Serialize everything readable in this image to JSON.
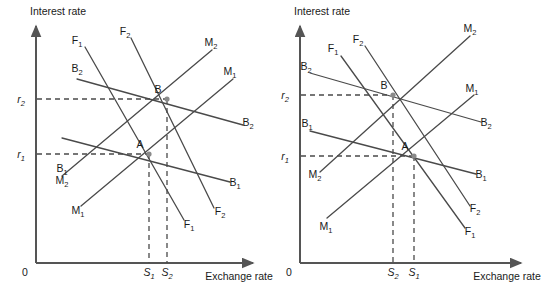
{
  "figure": {
    "title": "",
    "panels": [
      {
        "id": "left-panel",
        "name": "left-diagram",
        "origin_label": "0",
        "y_axis_label": "Interest rate",
        "x_axis_label": "Exchange rate",
        "axis": {
          "x0": 36,
          "y0": 263,
          "x_end": 253,
          "y_top": 26
        },
        "y_ticks": [
          {
            "label": "r",
            "sub": "2",
            "y": 99,
            "x": 21
          },
          {
            "label": "r",
            "sub": "1",
            "y": 154,
            "x": 21
          }
        ],
        "x_ticks": [
          {
            "label": "S",
            "sub": "1",
            "x": 149,
            "y": 276
          },
          {
            "label": "S",
            "sub": "2",
            "x": 167,
            "y": 276
          }
        ],
        "points": [
          {
            "label": "A",
            "x": 149,
            "y": 154,
            "lx": 140,
            "ly": 148
          },
          {
            "label": "B",
            "x": 167,
            "y": 99,
            "lx": 158,
            "ly": 93
          }
        ],
        "guides": [
          {
            "name": "guide-r2",
            "x1": 37,
            "y1": 99,
            "x2": 167,
            "y2": 99
          },
          {
            "name": "guide-r1",
            "x1": 37,
            "y1": 154,
            "x2": 149,
            "y2": 154
          },
          {
            "name": "guide-s1",
            "x1": 149,
            "y1": 154,
            "x2": 149,
            "y2": 263
          },
          {
            "name": "guide-s2",
            "x1": 167,
            "y1": 99,
            "x2": 167,
            "y2": 263
          }
        ],
        "curves": [
          {
            "name": "curve-F1",
            "x1": 85,
            "y1": 47,
            "x2": 184,
            "y2": 220,
            "label": "F",
            "sub": "1",
            "lx1": 77,
            "ly1": 44,
            "lx2": 189,
            "ly2": 228
          },
          {
            "name": "curve-F2",
            "x1": 131,
            "y1": 38,
            "x2": 214,
            "y2": 208,
            "label": "F",
            "sub": "2",
            "lx1": 125,
            "ly1": 35,
            "lx2": 220,
            "ly2": 215
          },
          {
            "name": "curve-M1",
            "x1": 81,
            "y1": 206,
            "x2": 233,
            "y2": 79,
            "label": "M",
            "sub": "1",
            "lx1": 78,
            "ly1": 214,
            "lx2": 230,
            "ly2": 75
          },
          {
            "name": "curve-M2",
            "x1": 62,
            "y1": 176,
            "x2": 212,
            "y2": 50,
            "label": "M",
            "sub": "2",
            "lx1": 62,
            "ly1": 184,
            "lx2": 211,
            "ly2": 46
          },
          {
            "name": "curve-B1",
            "x1": 62,
            "y1": 138,
            "x2": 230,
            "y2": 182,
            "label": "B",
            "sub": "1",
            "lx1": 62,
            "ly1": 172,
            "lx2": 235,
            "ly2": 186
          },
          {
            "name": "curve-B2",
            "x1": 77,
            "y1": 79,
            "x2": 243,
            "y2": 125,
            "label": "B",
            "sub": "2",
            "lx1": 77,
            "ly1": 72,
            "lx2": 248,
            "ly2": 126
          }
        ]
      },
      {
        "id": "right-panel",
        "name": "right-diagram",
        "origin_label": "0",
        "y_axis_label": "Interest rate",
        "x_axis_label": "Exchange rate",
        "axis": {
          "x0": 300,
          "y0": 263,
          "x_end": 521,
          "y_top": 26
        },
        "y_ticks": [
          {
            "label": "r",
            "sub": "2",
            "y": 95,
            "x": 285
          },
          {
            "label": "r",
            "sub": "1",
            "y": 156,
            "x": 285
          }
        ],
        "x_ticks": [
          {
            "label": "S",
            "sub": "2",
            "x": 393,
            "y": 276
          },
          {
            "label": "S",
            "sub": "1",
            "x": 414,
            "y": 276
          }
        ],
        "points": [
          {
            "label": "B",
            "x": 393,
            "y": 95,
            "lx": 384,
            "ly": 89
          },
          {
            "label": "A",
            "x": 414,
            "y": 156,
            "lx": 405,
            "ly": 150
          }
        ],
        "guides": [
          {
            "name": "guide-r2",
            "x1": 301,
            "y1": 95,
            "x2": 393,
            "y2": 95
          },
          {
            "name": "guide-r1",
            "x1": 301,
            "y1": 156,
            "x2": 414,
            "y2": 156
          },
          {
            "name": "guide-s2",
            "x1": 393,
            "y1": 95,
            "x2": 393,
            "y2": 263
          },
          {
            "name": "guide-s1",
            "x1": 414,
            "y1": 156,
            "x2": 414,
            "y2": 263
          }
        ],
        "curves": [
          {
            "name": "curve-F1",
            "x1": 341,
            "y1": 56,
            "x2": 465,
            "y2": 228,
            "label": "F",
            "sub": "1",
            "lx1": 333,
            "ly1": 52,
            "lx2": 470,
            "ly2": 235
          },
          {
            "name": "curve-F2",
            "x1": 365,
            "y1": 46,
            "x2": 470,
            "y2": 206,
            "label": "F",
            "sub": "2",
            "lx1": 358,
            "ly1": 43,
            "lx2": 475,
            "ly2": 212
          },
          {
            "name": "curve-M1",
            "x1": 327,
            "y1": 218,
            "x2": 474,
            "y2": 95,
            "label": "M",
            "sub": "1",
            "lx1": 326,
            "ly1": 230,
            "lx2": 472,
            "ly2": 92
          },
          {
            "name": "curve-M2",
            "x1": 320,
            "y1": 172,
            "x2": 470,
            "y2": 36,
            "label": "M",
            "sub": "2",
            "lx1": 315,
            "ly1": 178,
            "lx2": 470,
            "ly2": 32
          },
          {
            "name": "curve-B1",
            "x1": 310,
            "y1": 131,
            "x2": 476,
            "y2": 174,
            "label": "B",
            "sub": "1",
            "lx1": 307,
            "ly1": 127,
            "lx2": 481,
            "ly2": 178
          },
          {
            "name": "curve-B2",
            "x1": 310,
            "y1": 73,
            "x2": 481,
            "y2": 122,
            "label": "B",
            "sub": "2",
            "lx1": 306,
            "ly1": 70,
            "lx2": 486,
            "ly2": 126
          }
        ]
      }
    ]
  }
}
